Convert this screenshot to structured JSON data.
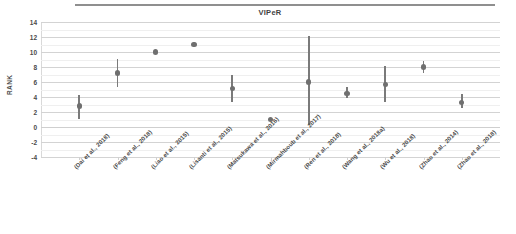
{
  "chart_data": {
    "type": "scatter",
    "title": "VIPeR",
    "xlabel": "",
    "ylabel": "RANK",
    "ylim": [
      -4,
      14
    ],
    "ytick_step": 2,
    "yticks": [
      "14",
      "12",
      "10",
      "8",
      "6",
      "4",
      "2",
      "0",
      "-2",
      "-4"
    ],
    "grid": true,
    "legend": "none",
    "marker_color": "#6f6f6f",
    "errorbar_color": "#7a7a7a",
    "categories": [
      "(Dai et al., 2018)",
      "(Feng et al., 2018)",
      "(Liao et al., 2015)",
      "(Lisanti et al., 2015)",
      "(Matsukawa et al., 2016)",
      "(Mirmahboub et al., 2017)",
      "(Ren et al., 2018)",
      "(Wang et al., 2018a)",
      "(Wu et al., 2018)",
      "(Zhao et al., 2014)",
      "(Zhao et al., 2018)"
    ],
    "values": [
      2.8,
      7.2,
      10.0,
      11.0,
      5.1,
      1.0,
      6.0,
      4.5,
      5.7,
      8.0,
      3.3
    ],
    "error_low": [
      1.1,
      5.4,
      10.0,
      11.0,
      3.4,
      1.0,
      0.3,
      3.9,
      3.4,
      7.2,
      2.5
    ],
    "error_high": [
      4.3,
      9.1,
      10.0,
      11.0,
      7.0,
      1.0,
      12.2,
      5.3,
      8.2,
      8.8,
      4.4
    ]
  },
  "chart": {
    "title": "VIPeR",
    "ylabel": "RANK"
  }
}
